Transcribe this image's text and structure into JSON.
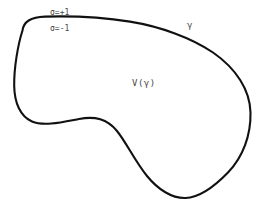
{
  "figure": {
    "background_color": "#ffffff",
    "stroke_color": "#111111",
    "text_color": "#4a4a4a",
    "width": 272,
    "height": 212
  },
  "labels": {
    "sigma_plus": "σ=+1",
    "sigma_minus": "σ=-1",
    "curve_name": "γ",
    "region_name": "V(γ)"
  },
  "curve": {
    "name": "gamma",
    "type": "closed-bean-contour",
    "stroke_width": 2.1,
    "path": "M 22.5 30.5 C 23.5 21.5 32 17.0 45 16.6 C 70 15.9 105 17.6 130 21.6 C 160 26.4 192 38.0 213 52.5 C 236 68.4 250 90.0 250.5 112.5 C 251 135.0 243 157.0 228 172.5 C 213.5 187.5 198 197.5 185.5 198.0 C 172 198.5 158 189.5 147 176.0 C 135 161.2 126 142.0 117 131.0 C 107 118.8 95 116.0 79 119.0 C 62 122.2 44 126.5 32 121.5 C 20.5 116.7 14.5 103.0 14.2 86.0 C 13.9 67.5 18.0 44.5 22.5 30.5 Z"
  }
}
